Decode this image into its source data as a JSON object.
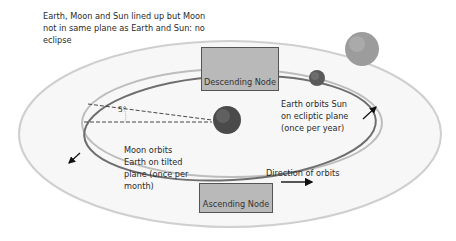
{
  "caption": {
    "line1": "Earth, Moon and Sun lined up but Moon",
    "line2": "not in same plane as Earth and Sun: no",
    "line3": "eclipse"
  },
  "nodes": {
    "descending": "Descending Node",
    "ascending": "Ascending Node"
  },
  "labels": {
    "earth_orbit": [
      "Earth orbits Sun",
      "on ecliptic plane",
      "(once per year)"
    ],
    "moon_orbit": [
      "Moon orbits",
      "Earth on tilted",
      "plane (once per",
      "month)"
    ],
    "direction": "Direction of orbits",
    "angle": "5°"
  },
  "colors": {
    "outer_orbit": "#cfcfcf",
    "ecliptic_orbit": "#b8b8b8",
    "moon_orbit": "#6a6a6a",
    "node_fill": "#b9b9b9",
    "sun": "#9a9a9a",
    "earth": "#4a4a4a",
    "moon": "#5e5e5e"
  }
}
